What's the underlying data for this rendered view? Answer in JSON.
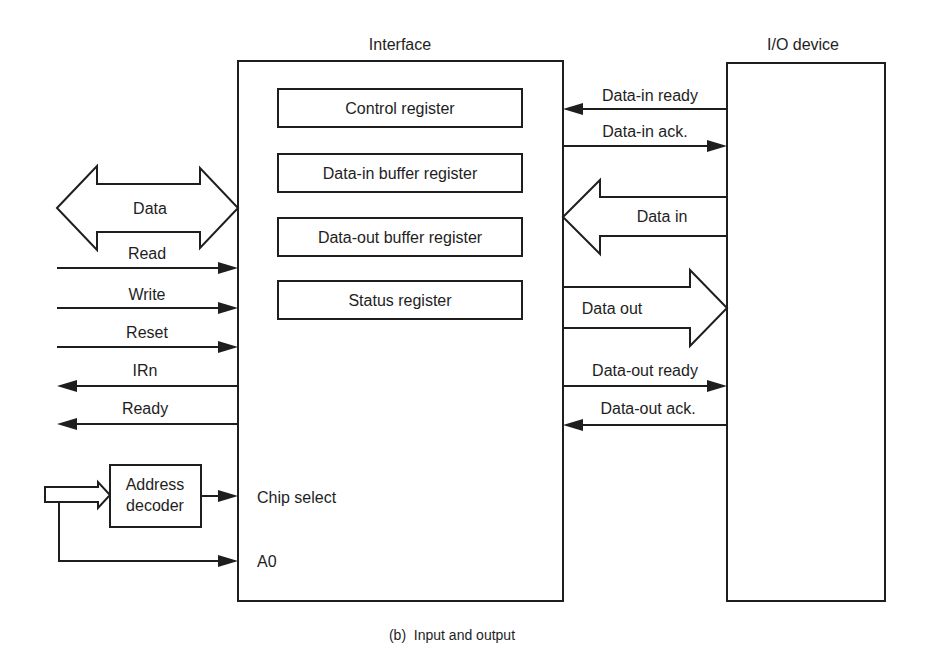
{
  "diagram": {
    "caption": "(b)  Input and output",
    "colors": {
      "ink": "#1e1e1e",
      "background": "#ffffff"
    },
    "interface": {
      "title": "Interface",
      "registers": [
        {
          "label": "Control register"
        },
        {
          "label": "Data-in buffer register"
        },
        {
          "label": "Data-out buffer register"
        },
        {
          "label": "Status register"
        }
      ],
      "inner_labels": {
        "chip_select": "Chip select",
        "a0": "A0"
      }
    },
    "io_device": {
      "title": "I/O device"
    },
    "cpu_side_signals": {
      "data_bus": {
        "label": "Data",
        "direction": "bidirectional"
      },
      "lines": [
        {
          "label": "Read",
          "direction": "in"
        },
        {
          "label": "Write",
          "direction": "in"
        },
        {
          "label": "Reset",
          "direction": "in"
        },
        {
          "label": "IRn",
          "direction": "out"
        },
        {
          "label": "Ready",
          "direction": "out"
        }
      ]
    },
    "address_decoder": {
      "line1": "Address",
      "line2": "decoder"
    },
    "device_side_signals": {
      "lines": [
        {
          "label": "Data-in ready",
          "direction": "to-interface"
        },
        {
          "label": "Data-in ack.",
          "direction": "to-device"
        },
        {
          "label": "Data in",
          "direction": "to-interface",
          "bus": true
        },
        {
          "label": "Data out",
          "direction": "to-device",
          "bus": true
        },
        {
          "label": "Data-out ready",
          "direction": "to-device"
        },
        {
          "label": "Data-out ack.",
          "direction": "to-interface"
        }
      ]
    }
  }
}
